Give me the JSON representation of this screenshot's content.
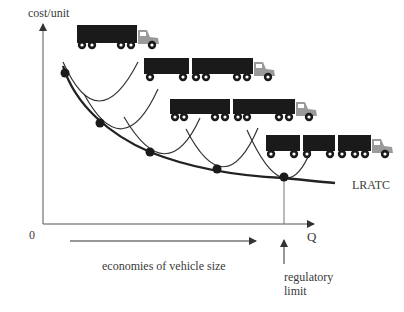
{
  "diagram": {
    "y_axis_label": "cost/unit",
    "x_axis_label": "Q",
    "origin_label": "0",
    "curve_label": "LRATC",
    "arrow_label": "economies of vehicle size",
    "limit_label_line1": "regulatory",
    "limit_label_line2": "limit"
  },
  "colors": {
    "ink": "#222222",
    "axis": "#555555",
    "trailer": "#1a1a1a",
    "cab": "#9a9a9a"
  },
  "trucks": [
    {
      "name": "single-trailer truck",
      "trailers": 1
    },
    {
      "name": "double-trailer truck",
      "trailers": 2
    },
    {
      "name": "double-trailer truck long",
      "trailers": 2
    },
    {
      "name": "triple-trailer truck",
      "trailers": 3
    }
  ],
  "tangent_points": [
    [
      65,
      73
    ],
    [
      100,
      123
    ],
    [
      150,
      152
    ],
    [
      217,
      169
    ],
    [
      284,
      177
    ]
  ]
}
